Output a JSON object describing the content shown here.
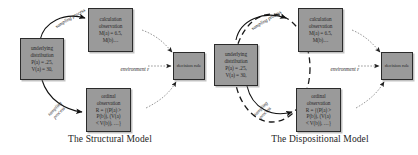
{
  "figure": {
    "panels": [
      {
        "id": "structural",
        "caption": "The Structural Model",
        "nodes": {
          "underlying": "underlying\ndistribution\nP(a) = .25,\nV(a) = 30,",
          "calculation": "calculation\nobservation\nM(a) = 6.5,\nM(b)…",
          "ordinal": "ordinal\nobservation\nR = {(P(a) >\nP(b)), (V(a)\n< V(b)), …}",
          "decision": "decision rule"
        },
        "edges": {
          "sampling_top": "sampling process",
          "sampling_bottom": "sampling\nprocess",
          "environment": "environment ε"
        }
      },
      {
        "id": "dispositional",
        "caption": "The Dispositional Model",
        "nodes": {
          "underlying": "underlying\ndistribution\nP(a) = .25,\nV(a) = 30,",
          "calculation": "calculation\nobservation\nM(a) = 6.5,\nM(b)…",
          "ordinal": "ordinal\nobservation\nR = {(P(a) >\nP(b)), (V(a)\n< V(b)), …}",
          "decision": "decision rule"
        },
        "edges": {
          "sampling_top": "sampling process",
          "sampling_bottom": "sampling\nprocess",
          "environment": "environment ε"
        }
      }
    ],
    "colors": {
      "node_fill": "#9a9a9a",
      "node_border": "#2b2b2b",
      "arrow_solid": "#1a1a1a",
      "arrow_dotted": "#8c8c8c",
      "ellipse_dashed": "#1a1a1a",
      "background": "#ffffff"
    }
  }
}
